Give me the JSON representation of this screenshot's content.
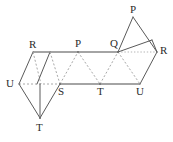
{
  "figure": {
    "canvas": {
      "width": 173,
      "height": 142
    },
    "colors": {
      "background": "#ffffff",
      "solid_edge": "#5a5a5a",
      "dashed_edge": "#a8a8a8",
      "dotted_edge": "#b5b5b5",
      "label_text": "#2b2b2b"
    },
    "labels": {
      "top_r": "R",
      "top_p": "P",
      "top_q": "Q",
      "apex_p": "P",
      "right_r": "R",
      "left_u": "U",
      "bottom_s": "S",
      "bottom_t": "T",
      "bottom_u": "U",
      "lower_t": "T"
    },
    "vertices": [
      {
        "name": "top-r",
        "label": "R",
        "x": 33,
        "y": 52
      },
      {
        "name": "top-p",
        "label": "P",
        "x": 78,
        "y": 52
      },
      {
        "name": "top-q",
        "label": "Q",
        "x": 118,
        "y": 52
      },
      {
        "name": "apex-p",
        "label": "P",
        "x": 133,
        "y": 17
      },
      {
        "name": "right-r",
        "label": "R",
        "x": 157,
        "y": 52
      },
      {
        "name": "left-u",
        "label": "U",
        "x": 19,
        "y": 84
      },
      {
        "name": "bottom-s",
        "label": "S",
        "x": 60,
        "y": 84
      },
      {
        "name": "bottom-t",
        "label": "T",
        "x": 100,
        "y": 84
      },
      {
        "name": "bottom-u",
        "label": "U",
        "x": 140,
        "y": 84
      },
      {
        "name": "lower-t",
        "label": "T",
        "x": 40,
        "y": 118
      }
    ]
  }
}
